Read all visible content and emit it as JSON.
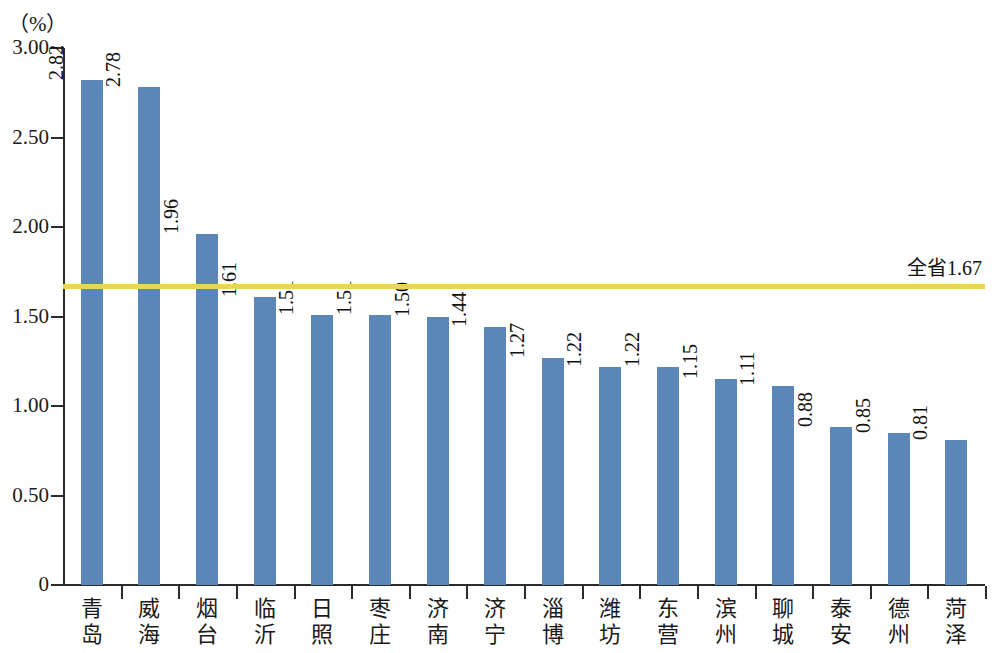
{
  "chart_data": {
    "type": "bar",
    "title": "",
    "subtitle": "",
    "xlabel": "",
    "ylabel": "（%）",
    "unit_label": "（%）",
    "categories": [
      "青岛",
      "威海",
      "烟台",
      "临沂",
      "日照",
      "枣庄",
      "济南",
      "济宁",
      "淄博",
      "潍坊",
      "东营",
      "滨州",
      "聊城",
      "泰安",
      "德州",
      "菏泽"
    ],
    "values": [
      2.82,
      2.78,
      1.96,
      1.61,
      1.51,
      1.51,
      1.5,
      1.44,
      1.27,
      1.22,
      1.22,
      1.15,
      1.11,
      0.88,
      0.85,
      0.81
    ],
    "value_labels": [
      "2.82",
      "2.78",
      "1.96",
      "1.61",
      "1.51",
      "1.51",
      "1.50",
      "1.44",
      "1.27",
      "1.22",
      "1.22",
      "1.15",
      "1.11",
      "0.88",
      "0.85",
      "0.81"
    ],
    "ylim": [
      0,
      3.0
    ],
    "yticks": [
      0,
      0.5,
      1.0,
      1.5,
      2.0,
      2.5,
      3.0
    ],
    "ytick_labels": [
      "0",
      "0.50",
      "1.00",
      "1.50",
      "2.00",
      "2.50",
      "3.00"
    ],
    "grid": false,
    "legend": false,
    "bar_color": "#5b86b8",
    "reference_line": {
      "value": 1.67,
      "label": "全省1.67",
      "color": "#e9d55c"
    }
  }
}
